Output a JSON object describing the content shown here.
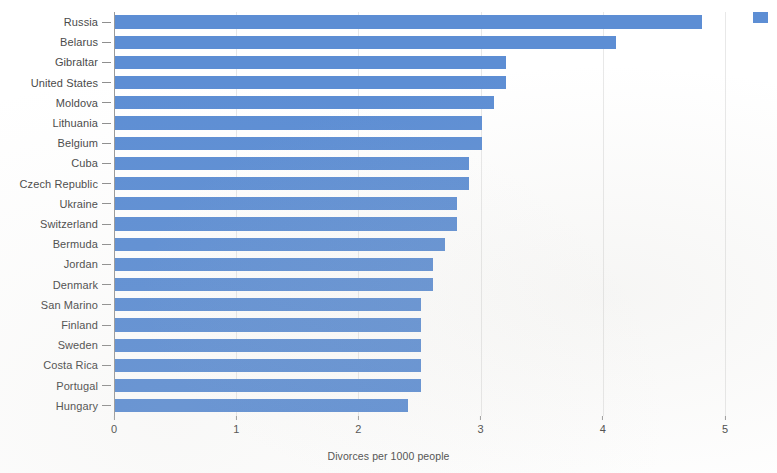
{
  "chart_data": {
    "type": "bar",
    "orientation": "horizontal",
    "title": "",
    "subtitle": "",
    "xlabel": "Divorces per 1000 people",
    "ylabel": "",
    "xlim": [
      0,
      5
    ],
    "xticks": [
      0,
      1,
      2,
      3,
      4,
      5
    ],
    "xtick_labels": [
      "0",
      "1",
      "2",
      "3",
      "4",
      "5"
    ],
    "grid": true,
    "grid_axis": "x",
    "legend": {
      "position": "top-right",
      "entries": [
        {
          "label": "",
          "color": "#5d8ed4"
        }
      ]
    },
    "bar_color": "#5d8ed4",
    "categories": [
      "Russia",
      "Belarus",
      "Gibraltar",
      "United States",
      "Moldova",
      "Lithuania",
      "Belgium",
      "Cuba",
      "Czech Republic",
      "Ukraine",
      "Switzerland",
      "Bermuda",
      "Jordan",
      "Denmark",
      "San Marino",
      "Finland",
      "Sweden",
      "Costa Rica",
      "Portugal",
      "Hungary"
    ],
    "values": [
      4.8,
      4.1,
      3.2,
      3.2,
      3.1,
      3.0,
      3.0,
      2.9,
      2.9,
      2.8,
      2.8,
      2.7,
      2.6,
      2.6,
      2.5,
      2.5,
      2.5,
      2.5,
      2.5,
      2.4
    ],
    "series": [
      {
        "name": "Divorces per 1000 people",
        "color": "#5d8ed4",
        "values": [
          4.8,
          4.1,
          3.2,
          3.2,
          3.1,
          3.0,
          3.0,
          2.9,
          2.9,
          2.8,
          2.8,
          2.7,
          2.6,
          2.6,
          2.5,
          2.5,
          2.5,
          2.5,
          2.5,
          2.4
        ]
      }
    ]
  },
  "axis": {
    "x_title": "Divorces per 1000 people"
  }
}
